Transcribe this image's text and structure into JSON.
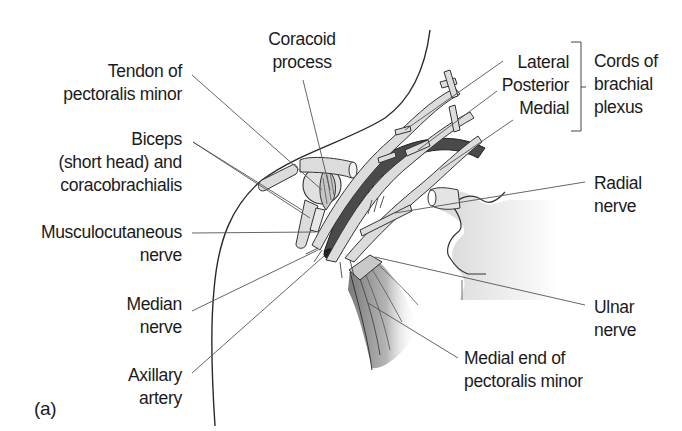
{
  "figure": {
    "panel_label": "(a)",
    "colors": {
      "outline": "#2a2a2a",
      "leader": "#555555",
      "nerve_fill": "#d9d9d9",
      "artery_fill": "#4a4a4a",
      "bone_fill": "#e2e2e2",
      "muscle_fill": "#8c8c8c"
    },
    "labels": {
      "tendon_pec_minor": [
        "Tendon of",
        "pectoralis minor"
      ],
      "coracoid": [
        "Coracoid",
        "process"
      ],
      "biceps": [
        "Biceps",
        "(short head) and",
        "coracobrachialis"
      ],
      "musculocutaneous": [
        "Musculocutaneous",
        "nerve"
      ],
      "median": [
        "Median",
        "nerve"
      ],
      "axillary_artery": [
        "Axillary",
        "artery"
      ],
      "cords": [
        "Lateral",
        "Posterior",
        "Medial"
      ],
      "cords_group": [
        "Cords of",
        "brachial",
        "plexus"
      ],
      "radial": [
        "Radial",
        "nerve"
      ],
      "ulnar": [
        "Ulnar",
        "nerve"
      ],
      "medial_end_pec_minor": [
        "Medial end of",
        "pectoralis minor"
      ]
    }
  }
}
